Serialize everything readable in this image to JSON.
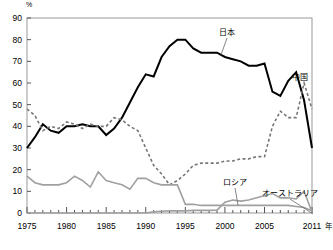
{
  "chart_data": {
    "type": "line",
    "title": "",
    "subtitle": "",
    "ylabel": "%",
    "xlabel": "年",
    "xlim": [
      1975,
      2011
    ],
    "ylim": [
      0,
      90
    ],
    "ytick_labels": [
      "0",
      "10",
      "20",
      "30",
      "40",
      "50",
      "60",
      "70",
      "80",
      "90"
    ],
    "yticks": [
      0,
      10,
      20,
      30,
      40,
      50,
      60,
      70,
      80,
      90
    ],
    "xtick_labels": [
      "1975",
      "1980",
      "1985",
      "1990",
      "1995",
      "2000",
      "2005",
      "2011"
    ],
    "xticks": [
      1975,
      1980,
      1985,
      1990,
      1995,
      2000,
      2005,
      2011
    ],
    "minor_xticks_every": 1,
    "grid": false,
    "legend_position": "inline-annotations",
    "x": [
      1975,
      1976,
      1977,
      1978,
      1979,
      1980,
      1981,
      1982,
      1983,
      1984,
      1985,
      1986,
      1987,
      1988,
      1989,
      1990,
      1991,
      1992,
      1993,
      1994,
      1995,
      1996,
      1997,
      1998,
      1999,
      2000,
      2001,
      2002,
      2003,
      2004,
      2005,
      2006,
      2007,
      2008,
      2009,
      2010,
      2011
    ],
    "series": [
      {
        "name": "日本",
        "label": "日本",
        "style": "solid",
        "color": "#000000",
        "width": 2.0,
        "values": [
          30,
          35,
          41,
          38,
          37,
          40,
          40,
          41,
          40,
          40,
          36,
          39,
          44,
          51,
          58,
          64,
          63,
          72,
          77,
          80,
          80,
          76,
          74,
          74,
          74,
          72,
          71,
          70,
          68,
          68,
          69,
          56,
          54,
          61,
          65,
          52,
          30
        ]
      },
      {
        "name": "中国",
        "label": "中国",
        "style": "dashed",
        "color": "#777777",
        "width": 1.6,
        "values": [
          48,
          45,
          38,
          40,
          39,
          42,
          41,
          39,
          41,
          40,
          40,
          44,
          43,
          40,
          38,
          30,
          22,
          18,
          13,
          15,
          18,
          22,
          23,
          23,
          23,
          24,
          24,
          25,
          25,
          26,
          26,
          40,
          47,
          44,
          44,
          60,
          48
        ]
      },
      {
        "name": "ロシア",
        "label": "ロシア",
        "style": "solid",
        "color": "#a0a0a0",
        "width": 1.6,
        "values": [
          0,
          0,
          0,
          0,
          0,
          0,
          0,
          0,
          0,
          0,
          0,
          0,
          0,
          0,
          0,
          0,
          0.5,
          0.8,
          1,
          1,
          1,
          1.2,
          1.2,
          1.2,
          1.3,
          5,
          6,
          5.5,
          6,
          7,
          8,
          9,
          7,
          7,
          6.5,
          10,
          0.5
        ]
      },
      {
        "name": "オーストラリア",
        "label": "オーストラリア",
        "style": "solid",
        "color": "#a0a0a0",
        "width": 1.6,
        "values": [
          17,
          14,
          13,
          13,
          13,
          14,
          17,
          15,
          12,
          19,
          15,
          14,
          13,
          11,
          16,
          16,
          14,
          13,
          13,
          13,
          4,
          4,
          3.5,
          3.5,
          3.5,
          3.5,
          3.5,
          3.5,
          3.5,
          3.5,
          3.5,
          3.5,
          3.5,
          3.5,
          3,
          2.5,
          1
        ]
      }
    ],
    "annotations": [
      {
        "text": "日本",
        "x_px": 227,
        "y_px": 35,
        "leader_to_x": 221,
        "leader_to_y": 55
      },
      {
        "text": "中国",
        "x_px": 300,
        "y_px": 80,
        "leader_to_x": 0,
        "leader_to_y": 0
      },
      {
        "text": "ロシア",
        "x_px": 235,
        "y_px": 185,
        "leader_to_x": 238,
        "leader_to_y": 205
      },
      {
        "text": "オーストラリア",
        "x_px": 290,
        "y_px": 196,
        "leader_to_x": 313,
        "leader_to_y": 214
      }
    ]
  }
}
